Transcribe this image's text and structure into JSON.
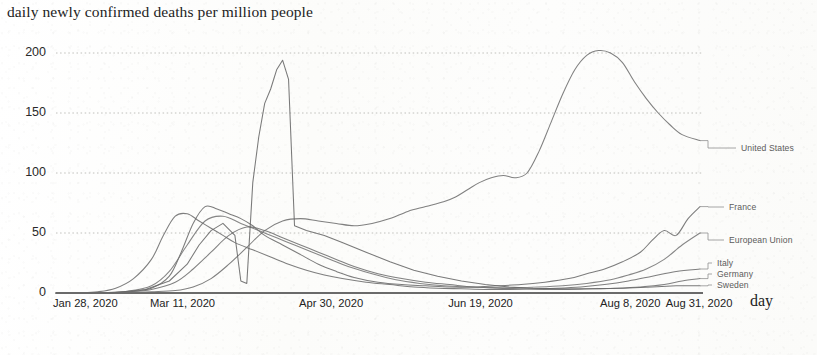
{
  "chart_data": {
    "type": "line",
    "title": "daily newly confirmed deaths per million people",
    "xlabel": "day",
    "ylabel": "",
    "ylim": [
      0,
      215
    ],
    "yticks": [
      0,
      50,
      100,
      150,
      200
    ],
    "ytick_labels": [
      "0",
      "50",
      "100",
      "150",
      "200"
    ],
    "grid": true,
    "grid_style": "dotted",
    "legend_position": "right-inline-labels",
    "xtick_labels": [
      "Jan 28, 2020",
      "Mar 11, 2020",
      "Apr 30, 2020",
      "Jun 19, 2020",
      "Aug 8, 2020",
      "Aug 31, 2020"
    ],
    "xtick_days": [
      0,
      43,
      93,
      143,
      193,
      216
    ],
    "x_range_days": [
      0,
      216
    ],
    "series": [
      {
        "name": "United States",
        "label_y_value": 127,
        "x": [
          0,
          8,
          16,
          24,
          32,
          40,
          46,
          52,
          58,
          64,
          70,
          76,
          82,
          88,
          94,
          100,
          106,
          112,
          118,
          124,
          130,
          134,
          138,
          142,
          146,
          150,
          154,
          158,
          162,
          166,
          170,
          174,
          178,
          182,
          186,
          190,
          194,
          198,
          202,
          206,
          210,
          216
        ],
        "values": [
          0,
          0,
          0,
          0.3,
          1,
          2,
          5,
          12,
          24,
          38,
          52,
          60,
          62,
          60,
          58,
          56,
          58,
          62,
          68,
          72,
          76,
          80,
          86,
          92,
          96,
          98,
          96,
          100,
          118,
          142,
          166,
          186,
          198,
          202,
          200,
          192,
          176,
          162,
          150,
          140,
          132,
          127
        ]
      },
      {
        "name": "France",
        "label_y_value": 72,
        "x": [
          0,
          8,
          16,
          24,
          32,
          38,
          42,
          46,
          50,
          54,
          58,
          62,
          66,
          70,
          76,
          82,
          88,
          94,
          100,
          108,
          116,
          124,
          132,
          140,
          148,
          156,
          164,
          172,
          178,
          184,
          190,
          196,
          200,
          204,
          208,
          212,
          216
        ],
        "values": [
          0,
          0,
          0.2,
          1,
          4,
          14,
          34,
          58,
          72,
          70,
          66,
          62,
          56,
          48,
          40,
          32,
          24,
          18,
          13,
          9,
          7,
          6,
          5,
          5,
          6,
          7,
          9,
          12,
          16,
          20,
          26,
          34,
          44,
          52,
          48,
          62,
          72
        ]
      },
      {
        "name": "European Union",
        "label_y_value": 50,
        "x": [
          0,
          8,
          16,
          24,
          32,
          38,
          44,
          50,
          56,
          62,
          68,
          74,
          80,
          86,
          92,
          98,
          106,
          114,
          122,
          130,
          138,
          146,
          154,
          162,
          170,
          178,
          186,
          192,
          198,
          204,
          210,
          216
        ],
        "values": [
          0,
          0,
          0.3,
          1.5,
          6,
          18,
          40,
          60,
          64,
          58,
          52,
          46,
          40,
          34,
          28,
          22,
          16,
          11,
          8,
          6,
          5,
          4.5,
          4.5,
          5,
          6,
          8,
          11,
          15,
          20,
          28,
          40,
          50
        ]
      },
      {
        "name": "Italy",
        "label_y_value": 20,
        "x": [
          0,
          8,
          14,
          20,
          26,
          32,
          36,
          40,
          44,
          48,
          52,
          56,
          60,
          66,
          72,
          78,
          84,
          90,
          96,
          104,
          112,
          120,
          128,
          136,
          144,
          152,
          160,
          168,
          176,
          184,
          192,
          200,
          208,
          216
        ],
        "values": [
          0,
          0.2,
          1,
          4,
          12,
          28,
          48,
          64,
          66,
          60,
          54,
          48,
          42,
          36,
          30,
          24,
          19,
          15,
          12,
          9,
          7,
          5,
          4,
          3.5,
          3,
          3,
          3.5,
          4,
          5,
          7,
          10,
          14,
          18,
          20
        ]
      },
      {
        "name": "Germany",
        "label_y_value": 12,
        "x": [
          0,
          8,
          16,
          24,
          32,
          40,
          46,
          52,
          58,
          64,
          70,
          76,
          82,
          88,
          94,
          100,
          108,
          116,
          124,
          132,
          140,
          148,
          156,
          164,
          172,
          180,
          188,
          196,
          204,
          210,
          216
        ],
        "values": [
          0,
          0,
          0.3,
          1,
          3,
          9,
          20,
          34,
          48,
          55,
          52,
          46,
          40,
          34,
          28,
          22,
          16,
          12,
          9,
          7,
          5,
          4,
          3.5,
          3,
          3,
          3.5,
          4,
          5,
          7,
          10,
          12
        ]
      },
      {
        "name": "Sweden",
        "label_y_value": 6,
        "x": [
          0,
          10,
          20,
          30,
          38,
          44,
          48,
          52,
          56,
          60,
          62,
          64,
          66,
          68,
          70,
          72,
          74,
          76,
          78,
          80,
          84,
          90,
          96,
          104,
          112,
          120,
          128,
          136,
          144,
          152,
          160,
          170,
          180,
          190,
          200,
          208,
          216
        ],
        "values": [
          0,
          0,
          0.5,
          3,
          10,
          24,
          40,
          52,
          58,
          48,
          10,
          8,
          92,
          130,
          158,
          170,
          186,
          194,
          178,
          56,
          52,
          48,
          42,
          34,
          26,
          19,
          14,
          10,
          7,
          5,
          4,
          3.5,
          3.5,
          4,
          5,
          6,
          6
        ]
      }
    ]
  }
}
